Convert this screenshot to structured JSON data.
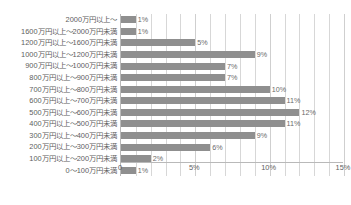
{
  "title_strip": "",
  "chart_data": {
    "type": "bar",
    "orientation": "horizontal",
    "title": "",
    "xlabel": "",
    "ylabel": "",
    "xlim": [
      0,
      15
    ],
    "xticks": [
      0,
      5,
      10,
      15
    ],
    "xtick_labels": [
      "0",
      "5%",
      "10%",
      "15%"
    ],
    "grid": true,
    "grid_interval": 1,
    "legend": "none",
    "bar_color": "#8f8f8f",
    "axis_color": "#b9b9b9",
    "gridline_color": "#d7d7d7",
    "text_color": "#5e5e5e",
    "value_suffix": "%",
    "categories": [
      "2000万円以上～",
      "1600万円以上～2000万円未満",
      "1200万円以上～1600万円未満",
      "1000万円以上～1200万円未満",
      "900万円以上～1000万円未満",
      "800万円以上～900万円未満",
      "700万円以上～800万円未満",
      "600万円以上～700万円未満",
      "500万円以上～600万円未満",
      "400万円以上～500万円未満",
      "300万円以上～400万円未満",
      "200万円以上～300万円未満",
      "100万円以上～200万円未満",
      "0～100万円未満"
    ],
    "values": [
      1,
      1,
      5,
      9,
      7,
      7,
      10,
      11,
      12,
      11,
      9,
      6,
      2,
      1
    ],
    "value_labels": [
      "1%",
      "1%",
      "5%",
      "9%",
      "7%",
      "7%",
      "10%",
      "11%",
      "12%",
      "11%",
      "9%",
      "6%",
      "2%",
      "1%"
    ]
  }
}
